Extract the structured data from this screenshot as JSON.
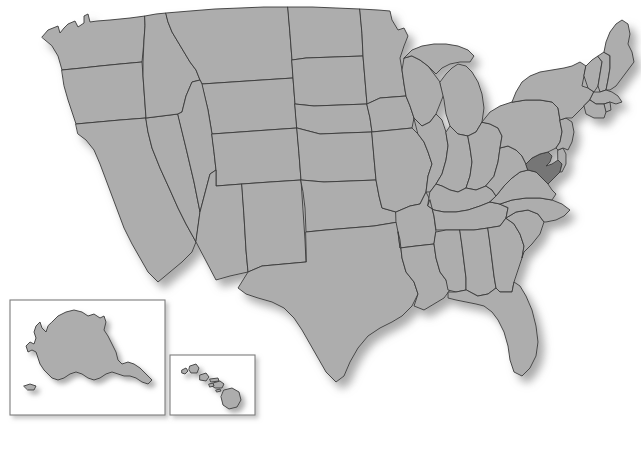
{
  "map": {
    "title": "United States Map",
    "type": "choropleth-locator",
    "projection": "albers-usa",
    "background_color": "#ffffff",
    "default_state_fill": "#adadad",
    "highlight_fill": "#767676",
    "border_color": "#3a3a3a",
    "inset_border_color": "#7d7d7d",
    "shadow": "drop-shadow-lower-right",
    "highlighted_regions": [
      "Maryland"
    ],
    "labels_visible": false,
    "legend_visible": false,
    "insets": [
      {
        "name": "Alaska",
        "label": "",
        "x": 10,
        "y": 300,
        "width": 155,
        "height": 115
      },
      {
        "name": "Hawaii",
        "label": "",
        "x": 170,
        "y": 355,
        "width": 85,
        "height": 60
      }
    ],
    "regions": [
      {
        "name": "Washington",
        "highlighted": false
      },
      {
        "name": "Oregon",
        "highlighted": false
      },
      {
        "name": "California",
        "highlighted": false
      },
      {
        "name": "Nevada",
        "highlighted": false
      },
      {
        "name": "Idaho",
        "highlighted": false
      },
      {
        "name": "Montana",
        "highlighted": false
      },
      {
        "name": "Wyoming",
        "highlighted": false
      },
      {
        "name": "Utah",
        "highlighted": false
      },
      {
        "name": "Arizona",
        "highlighted": false
      },
      {
        "name": "New Mexico",
        "highlighted": false
      },
      {
        "name": "Colorado",
        "highlighted": false
      },
      {
        "name": "North Dakota",
        "highlighted": false
      },
      {
        "name": "South Dakota",
        "highlighted": false
      },
      {
        "name": "Nebraska",
        "highlighted": false
      },
      {
        "name": "Kansas",
        "highlighted": false
      },
      {
        "name": "Oklahoma",
        "highlighted": false
      },
      {
        "name": "Texas",
        "highlighted": false
      },
      {
        "name": "Minnesota",
        "highlighted": false
      },
      {
        "name": "Iowa",
        "highlighted": false
      },
      {
        "name": "Missouri",
        "highlighted": false
      },
      {
        "name": "Arkansas",
        "highlighted": false
      },
      {
        "name": "Louisiana",
        "highlighted": false
      },
      {
        "name": "Wisconsin",
        "highlighted": false
      },
      {
        "name": "Illinois",
        "highlighted": false
      },
      {
        "name": "Michigan",
        "highlighted": false
      },
      {
        "name": "Indiana",
        "highlighted": false
      },
      {
        "name": "Ohio",
        "highlighted": false
      },
      {
        "name": "Kentucky",
        "highlighted": false
      },
      {
        "name": "Tennessee",
        "highlighted": false
      },
      {
        "name": "Mississippi",
        "highlighted": false
      },
      {
        "name": "Alabama",
        "highlighted": false
      },
      {
        "name": "Georgia",
        "highlighted": false
      },
      {
        "name": "Florida",
        "highlighted": false
      },
      {
        "name": "South Carolina",
        "highlighted": false
      },
      {
        "name": "North Carolina",
        "highlighted": false
      },
      {
        "name": "Virginia",
        "highlighted": false
      },
      {
        "name": "West Virginia",
        "highlighted": false
      },
      {
        "name": "Maryland",
        "highlighted": true
      },
      {
        "name": "Delaware",
        "highlighted": false
      },
      {
        "name": "Pennsylvania",
        "highlighted": false
      },
      {
        "name": "New Jersey",
        "highlighted": false
      },
      {
        "name": "New York",
        "highlighted": false
      },
      {
        "name": "Connecticut",
        "highlighted": false
      },
      {
        "name": "Rhode Island",
        "highlighted": false
      },
      {
        "name": "Massachusetts",
        "highlighted": false
      },
      {
        "name": "Vermont",
        "highlighted": false
      },
      {
        "name": "New Hampshire",
        "highlighted": false
      },
      {
        "name": "Maine",
        "highlighted": false
      },
      {
        "name": "Alaska",
        "highlighted": false
      },
      {
        "name": "Hawaii",
        "highlighted": false
      }
    ]
  }
}
